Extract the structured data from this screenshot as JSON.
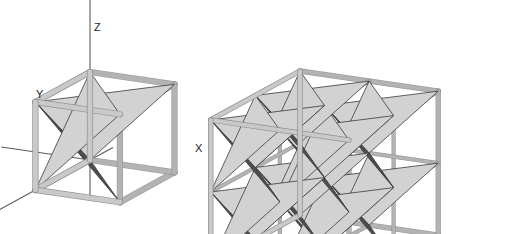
{
  "figure": {
    "title_visible": false,
    "background_color": "#ffffff",
    "panels": [
      {
        "id": "left-panel",
        "name": "single-unit-cell",
        "description": "Stella octangula (compound of two interpenetrating tetrahedra) inscribed in a single cubic unit cell, shown with coordinate axes",
        "axes": {
          "show": true,
          "labels": [
            {
              "name": "x-axis-label",
              "text": "X",
              "x": 195,
              "y": 152
            },
            {
              "name": "y-axis-label",
              "text": "Y",
              "x": 36,
              "y": 98
            },
            {
              "name": "z-axis-label",
              "text": "Z",
              "x": 94,
              "y": 31
            }
          ],
          "line_color": "#5a5a5a"
        },
        "cells": 1,
        "origin": {
          "x": 90,
          "y": 160
        },
        "cell_size": 88
      },
      {
        "id": "right-panel",
        "name": "supercell-2x2x2",
        "description": "2x2x2 array of stella octangula unit cells forming a supercell, cubic frame outline",
        "axes": {
          "show": false,
          "labels": []
        },
        "cells": 8,
        "origin": {
          "x": 300,
          "y": 215
        },
        "cell_size": 72
      }
    ],
    "colors": {
      "face_dark": "#4d4d4d",
      "face_light": "#d2d2d2",
      "face_mid": "#9a9a9a",
      "edge_dark": "#3a3a3a",
      "frame_light": "#b3b3b3",
      "frame_shade": "#8f8f8f",
      "frame_highlight": "#c9c9c9",
      "axis": "#5a5a5a",
      "background": "#ffffff",
      "label": "#1a1a1a"
    },
    "projection": {
      "type": "axonometric",
      "ax": -0.62,
      "ay": 0.34,
      "bx": 0.96,
      "by": 0.14,
      "cx": 0.0,
      "cy": -1.0
    }
  },
  "chart_data": {
    "type": "diagram",
    "annotations": [
      "X",
      "Y",
      "Z"
    ]
  }
}
